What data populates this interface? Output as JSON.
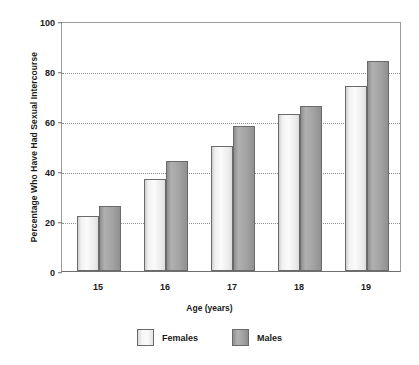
{
  "chart_data": {
    "type": "bar",
    "title": "",
    "subtitle": "",
    "xlabel": "Age (years)",
    "ylabel": "Percentage Who Have Had Sexual Intercourse",
    "categories": [
      "15",
      "16",
      "17",
      "18",
      "19"
    ],
    "series": [
      {
        "name": "Females",
        "color": "#f0f0f0",
        "values": [
          22,
          37,
          50,
          63,
          74
        ]
      },
      {
        "name": "Males",
        "color": "#9e9e9e",
        "values": [
          26,
          44,
          58,
          66,
          84
        ]
      }
    ],
    "ylim": [
      0,
      100
    ],
    "yticks": [
      0,
      20,
      40,
      60,
      80,
      100
    ],
    "ytick_labels": [
      "0",
      "20",
      "40",
      "60",
      "80",
      "100"
    ],
    "gridlines": [
      20,
      40,
      60,
      80
    ],
    "grid": true,
    "legend_position": "bottom"
  }
}
